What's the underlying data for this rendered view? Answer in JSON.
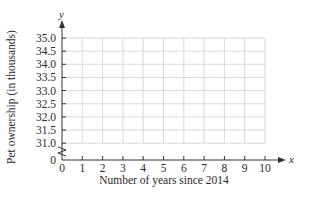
{
  "chart_data": {
    "type": "line",
    "title": "",
    "xlabel": "Number of years since 2014",
    "ylabel": "Pet ownership (in thousands)",
    "x_axis_var": "x",
    "y_axis_var": "y",
    "x_ticks": [
      "0",
      "1",
      "2",
      "3",
      "4",
      "5",
      "6",
      "7",
      "8",
      "9",
      "10"
    ],
    "y_ticks": [
      "0",
      "31.0",
      "31.5",
      "32.0",
      "32.5",
      "33.0",
      "33.5",
      "34.0",
      "34.5",
      "35.0"
    ],
    "xlim": [
      0,
      10
    ],
    "ylim": [
      31.0,
      35.0
    ],
    "y_axis_break": true,
    "grid": true,
    "series": []
  },
  "colors": {
    "grid": "#cfcfcf",
    "axis": "#333333",
    "text": "#2a2a2a"
  }
}
